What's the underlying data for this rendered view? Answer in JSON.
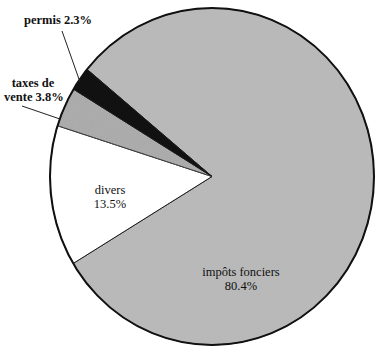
{
  "chart_data": {
    "type": "pie",
    "title": "",
    "categories": [
      "impôts fonciers",
      "divers",
      "taxes de vente",
      "permis"
    ],
    "values": [
      80.4,
      13.5,
      3.8,
      2.3
    ],
    "unit": "%",
    "colors": [
      "#b8b8b8",
      "#ffffff",
      "#a9a9a9",
      "#111111"
    ],
    "start_angle_deg": -140.5,
    "direction": "clockwise",
    "legend": "none",
    "labels": [
      {
        "name": "impôts fonciers",
        "value_text": "80.4%",
        "position": "inside"
      },
      {
        "name": "divers",
        "value_text": "13.5%",
        "position": "inside"
      },
      {
        "name": "taxes de vente",
        "value_text": "3.8%",
        "position": "outside-leader"
      },
      {
        "name": "permis",
        "value_text": "2.3%",
        "position": "outside-leader"
      }
    ]
  },
  "labels": {
    "permis": "permis 2.3%",
    "taxes_line1": "taxes de",
    "taxes_line2": "vente 3.8%",
    "divers_name": "divers",
    "divers_value": "13.5%",
    "impots_name": "impôts fonciers",
    "impots_value": "80.4%"
  }
}
